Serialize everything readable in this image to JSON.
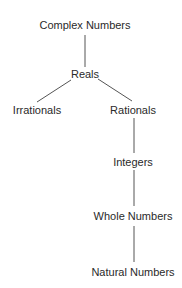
{
  "diagram": {
    "type": "hierarchy-tree",
    "colors": {
      "text": "#2a2a2a",
      "line": "#555555",
      "background": "#ffffff"
    },
    "nodes": {
      "complex": {
        "label": "Complex Numbers",
        "x": 85,
        "y": 25
      },
      "reals": {
        "label": "Reals",
        "x": 85,
        "y": 74
      },
      "irrationals": {
        "label": "Irrationals",
        "x": 37,
        "y": 110
      },
      "rationals": {
        "label": "Rationals",
        "x": 133,
        "y": 110
      },
      "integers": {
        "label": "Integers",
        "x": 133,
        "y": 162
      },
      "whole": {
        "label": "Whole Numbers",
        "x": 133,
        "y": 216
      },
      "natural": {
        "label": "Natural Numbers",
        "x": 133,
        "y": 272
      }
    },
    "edges": [
      {
        "from": "complex",
        "to": "reals"
      },
      {
        "from": "reals",
        "to": "irrationals"
      },
      {
        "from": "reals",
        "to": "rationals"
      },
      {
        "from": "rationals",
        "to": "integers"
      },
      {
        "from": "integers",
        "to": "whole"
      },
      {
        "from": "whole",
        "to": "natural"
      }
    ]
  }
}
